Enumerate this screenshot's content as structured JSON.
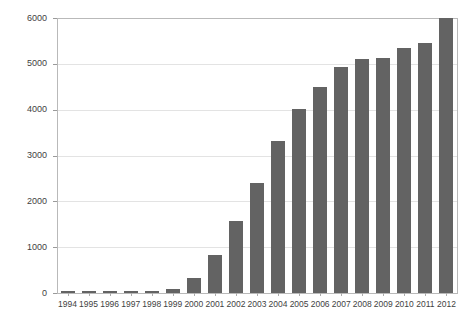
{
  "chart_data": {
    "type": "bar",
    "title": "",
    "subtitle": "",
    "xlabel": "",
    "ylabel": "",
    "categories": [
      "1994",
      "1995",
      "1996",
      "1997",
      "1998",
      "1999",
      "2000",
      "2001",
      "2002",
      "2003",
      "2004",
      "2005",
      "2006",
      "2007",
      "2008",
      "2009",
      "2010",
      "2011",
      "2012"
    ],
    "values": [
      5,
      8,
      12,
      18,
      25,
      95,
      320,
      830,
      1580,
      2400,
      3320,
      4020,
      4500,
      4930,
      5110,
      5120,
      5350,
      5450,
      6000
    ],
    "series": [
      {
        "name": "",
        "values": [
          5,
          8,
          12,
          18,
          25,
          95,
          320,
          830,
          1580,
          2400,
          3320,
          4020,
          4500,
          4930,
          5110,
          5120,
          5350,
          5450,
          6000
        ]
      }
    ],
    "ylim": [
      0,
      6000
    ],
    "yticks": [
      0,
      1000,
      2000,
      3000,
      4000,
      5000,
      6000
    ],
    "ytick_labels": [
      "0",
      "1000",
      "2000",
      "3000",
      "4000",
      "5000",
      "6000"
    ],
    "grid": true,
    "grid_axis": "y",
    "legend": false,
    "legend_position": "none",
    "bar_color": "#636363",
    "grid_color": "#e3e3e3",
    "axis_color": "#b9b9b9",
    "background_color": "#ffffff",
    "annotations": []
  }
}
